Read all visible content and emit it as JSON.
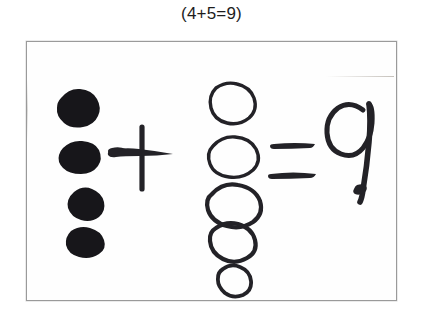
{
  "caption": {
    "text": "(4+5=9)"
  },
  "figure": {
    "equation": {
      "left_addend": "4",
      "operator": "+",
      "right_addend": "5",
      "equals": "=",
      "result": "9"
    },
    "groups": {
      "filled_dots": {
        "label": "filled dots group",
        "count": 4,
        "style": "solid ink blob",
        "color": "#17161a",
        "represents": "4"
      },
      "hollow_circles": {
        "label": "hollow circles group",
        "count": 5,
        "style": "open outline circle",
        "color": "#232227",
        "represents": "5"
      }
    },
    "marks": {
      "plus_sign": "+",
      "equals_sign": "=",
      "answer_digit": "9"
    }
  },
  "colors": {
    "page_background": "#ffffff",
    "scan_background": "#fefefe",
    "frame_border": "#9a9a9a",
    "ink": "#232227",
    "caption_text": "#1d1d1d"
  }
}
